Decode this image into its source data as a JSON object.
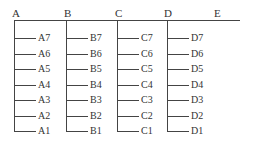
{
  "diagram": {
    "title": "",
    "columns": [
      {
        "label": "A",
        "x": 14,
        "items": [
          "A7",
          "A6",
          "A5",
          "A4",
          "A3",
          "A2",
          "A1"
        ]
      },
      {
        "label": "B",
        "x": 66,
        "items": [
          "B7",
          "B6",
          "B5",
          "B4",
          "B3",
          "B2",
          "B1"
        ]
      },
      {
        "label": "C",
        "x": 117,
        "items": [
          "C7",
          "C6",
          "C5",
          "C4",
          "C3",
          "C2",
          "C1"
        ]
      },
      {
        "label": "D",
        "x": 167,
        "items": [
          "D7",
          "D6",
          "D5",
          "D4",
          "D3",
          "D2",
          "D1"
        ]
      },
      {
        "label": "E",
        "x": 217,
        "items": []
      }
    ]
  }
}
